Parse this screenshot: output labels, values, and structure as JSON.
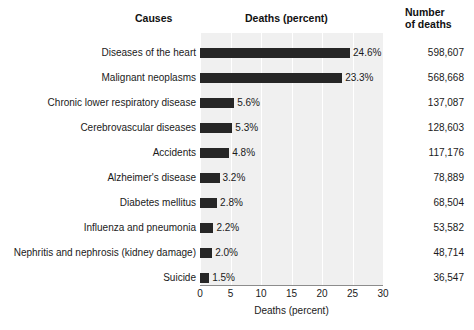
{
  "headers": {
    "causes": "Causes",
    "deaths_percent": "Deaths (percent)",
    "number_line1": "Number",
    "number_line2": "of deaths"
  },
  "axis": {
    "title": "Deaths (percent)",
    "ticks": [
      "0",
      "5",
      "10",
      "15",
      "20",
      "25",
      "30"
    ]
  },
  "colors": {
    "bar": "#262626",
    "plot_background": "#f0f0f0",
    "gridline": "#ffffff",
    "axis_line": "#8c8c8c",
    "text": "#1a1a1a"
  },
  "chart_data": {
    "type": "bar",
    "title": "Deaths (percent)",
    "xlabel": "Deaths (percent)",
    "ylabel": "Causes",
    "orientation": "horizontal",
    "xlim": [
      0,
      30
    ],
    "xticks": [
      0,
      5,
      10,
      15,
      20,
      25,
      30
    ],
    "grid": true,
    "legend": "none",
    "categories": [
      "Diseases of the heart",
      "Malignant neoplasms",
      "Chronic lower respiratory disease",
      "Cerebrovascular diseases",
      "Accidents",
      "Alzheimer's disease",
      "Diabetes mellitus",
      "Influenza and pneumonia",
      "Nephritis and nephrosis (kidney damage)",
      "Suicide"
    ],
    "values": [
      24.6,
      23.3,
      5.6,
      5.3,
      4.8,
      3.2,
      2.8,
      2.2,
      2.0,
      1.5
    ],
    "value_labels": [
      "24.6%",
      "23.3%",
      "5.6%",
      "5.3%",
      "4.8%",
      "3.2%",
      "2.8%",
      "2.2%",
      "2.0%",
      "1.5%"
    ],
    "number_of_deaths": [
      "598,607",
      "568,668",
      "137,087",
      "128,603",
      "117,176",
      "78,889",
      "68,504",
      "53,582",
      "48,714",
      "36,547"
    ]
  }
}
